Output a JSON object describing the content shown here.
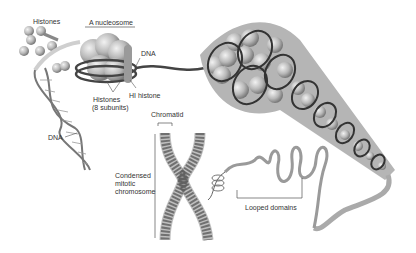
{
  "diagram": {
    "labels": {
      "histones_top": "Histones",
      "nucleosome": "A nucleosome",
      "dna_right": "DNA",
      "h1_histone": "HI histone",
      "histones_subunits_1": "Histones",
      "histones_subunits_2": "(8 subunits)",
      "dna_helix": "DNA",
      "chromatid": "Chromatid",
      "condensed_1": "Condensed",
      "condensed_2": "mitotic",
      "condensed_3": "chromosome",
      "looped_domains": "Looped domains"
    }
  }
}
